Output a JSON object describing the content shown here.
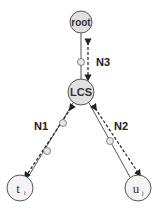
{
  "diagram": {
    "type": "tree-path-diagram",
    "nodes": [
      {
        "id": "root",
        "label": "root"
      },
      {
        "id": "lcs",
        "label": "LCS"
      },
      {
        "id": "ti",
        "label": "t",
        "subscript": "i"
      },
      {
        "id": "uj",
        "label": "u",
        "subscript": "j"
      }
    ],
    "edges": [
      {
        "from": "root",
        "to": "lcs",
        "label": "N3"
      },
      {
        "from": "lcs",
        "to": "ti",
        "label": "N1"
      },
      {
        "from": "lcs",
        "to": "uj",
        "label": "N2"
      }
    ],
    "colors": {
      "node_fill": "#e0e0e0",
      "node_stroke": "#555555",
      "line": "#444444",
      "arrow": "#222222"
    }
  }
}
